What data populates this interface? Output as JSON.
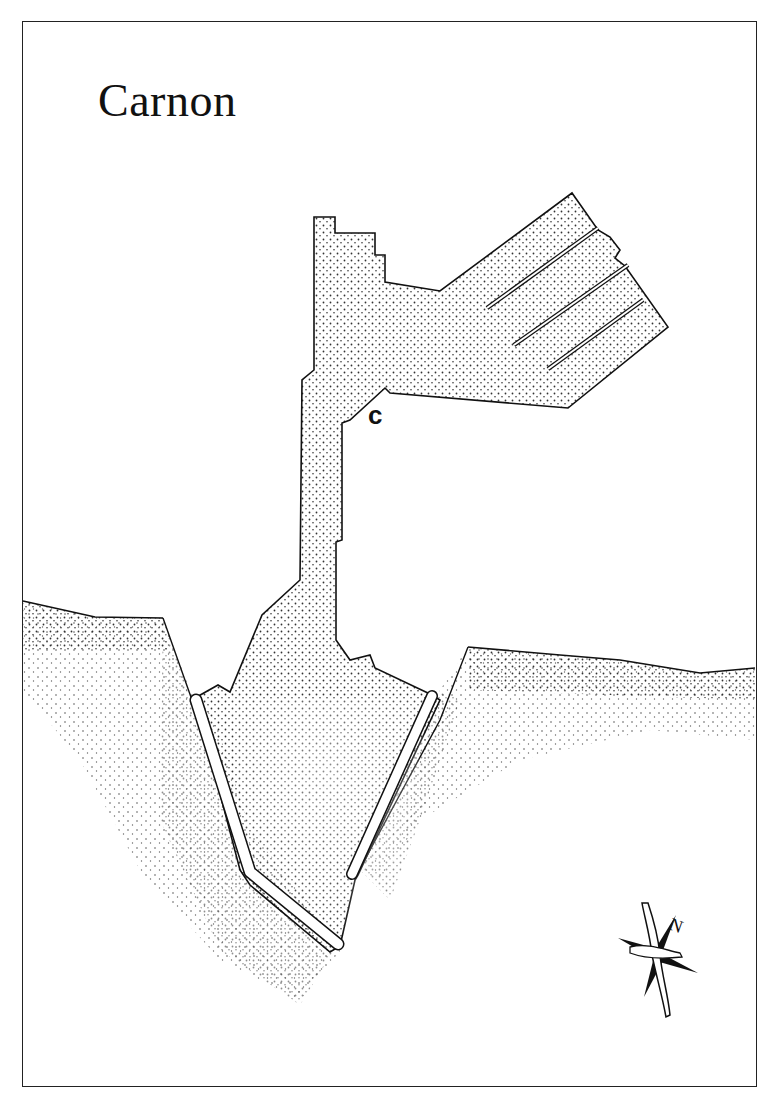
{
  "map": {
    "title": "Carnon",
    "labels": [
      {
        "id": "c",
        "text": "c"
      }
    ],
    "compass": {
      "icon": "compass-rose-icon",
      "north_label": "N"
    },
    "colors": {
      "ink": "#111111",
      "paper": "#ffffff",
      "stipple": "#333333"
    }
  }
}
